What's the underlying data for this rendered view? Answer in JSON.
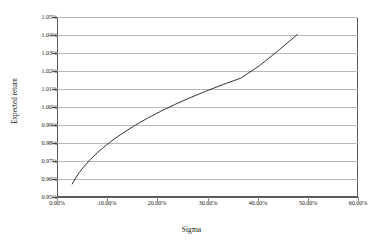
{
  "chart_data": {
    "type": "line",
    "title": "",
    "xlabel": "Sigma",
    "ylabel": "Expected return",
    "xlim": [
      0,
      60
    ],
    "ylim": [
      0.95,
      1.05
    ],
    "grid": "horizontal",
    "legend": "none",
    "x_tick_labels": [
      "0.00%",
      "10.00%",
      "20.00%",
      "30.00%",
      "40.00%",
      "50.00%",
      "60.00%"
    ],
    "x_tick_values": [
      0,
      10,
      20,
      30,
      40,
      50,
      60
    ],
    "y_tick_labels": [
      "1.05%",
      "1.04%",
      "1.03%",
      "1.02%",
      "1.01%",
      "1.00%",
      "0.99%",
      "0.98%",
      "0.97%",
      "0.96%",
      "0.95%"
    ],
    "y_tick_values": [
      1.05,
      1.04,
      1.03,
      1.02,
      1.01,
      1.0,
      0.99,
      0.98,
      0.97,
      0.96,
      0.95
    ],
    "series": [
      {
        "name": "Efficient frontier",
        "color": "#333333",
        "x": [
          3.0,
          3.6,
          4.4,
          5.4,
          6.6,
          8.0,
          9.6,
          11.4,
          13.4,
          15.6,
          18.0,
          20.6,
          23.4,
          26.4,
          29.6,
          33.0,
          36.6,
          40.4,
          44.4,
          48.0
        ],
        "y": [
          0.957,
          0.96,
          0.9635,
          0.967,
          0.9707,
          0.9745,
          0.9783,
          0.9822,
          0.986,
          0.9899,
          0.9937,
          0.9975,
          1.0013,
          1.005,
          1.0087,
          1.0124,
          1.016,
          1.023,
          1.032,
          1.0405
        ]
      }
    ]
  },
  "axis": {
    "x_title": "Sigma",
    "y_title": "Expected return"
  }
}
